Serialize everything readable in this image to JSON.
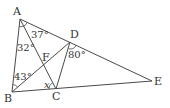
{
  "figure": {
    "points": {
      "A": {
        "label": "A",
        "x": 20,
        "y": 19
      },
      "B": {
        "label": "B",
        "x": 12,
        "y": 92
      },
      "C": {
        "label": "C",
        "x": 56,
        "y": 89
      },
      "D": {
        "label": "D",
        "x": 70,
        "y": 42
      },
      "E": {
        "label": "E",
        "x": 152,
        "y": 81
      },
      "F": {
        "label": "F",
        "x": 44,
        "y": 62
      }
    },
    "segments": [
      "AB",
      "AE",
      "BE",
      "AC",
      "BD",
      "DC"
    ],
    "angles": {
      "DAC": "37°",
      "BAC": "32°",
      "ABD": "43°",
      "ADC": "80°",
      "ACB": "x"
    },
    "colors": {
      "line": "#4a4a4a",
      "text": "#333333",
      "background": "#ffffff"
    }
  }
}
